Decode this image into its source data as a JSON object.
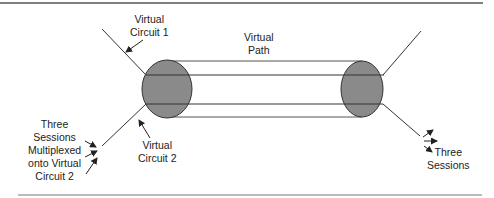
{
  "diagram": {
    "labels": {
      "vc1": [
        "Virtual",
        "Circuit 1"
      ],
      "vpath": [
        "Virtual",
        "Path"
      ],
      "vc2": [
        "Virtual",
        "Circuit 2"
      ],
      "sessions_in": [
        "Three",
        "Sessions",
        "Multiplexed",
        "onto Virtual",
        "Circuit 2"
      ],
      "sessions_out": [
        "Three",
        "Sessions"
      ]
    },
    "colors": {
      "ellipse_fill": "#8a8a8a",
      "stroke": "#333333",
      "rule": "#555555"
    }
  }
}
